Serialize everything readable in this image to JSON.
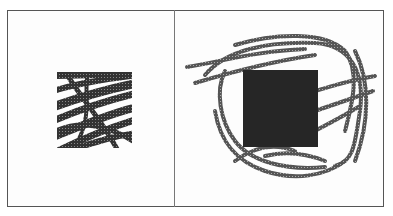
{
  "figure": {
    "panels": [
      {
        "id": "left",
        "description": "cropped scribble patch (square region of dense diagonal strokes)"
      },
      {
        "id": "right",
        "description": "full scribble strokes surrounding a solid dark square mask"
      }
    ],
    "colors": {
      "frame": "#555555",
      "divider": "#777777",
      "stroke": "#2b2b2b",
      "mask": "#262626",
      "background": "#fdfdfd"
    },
    "caption": ""
  }
}
